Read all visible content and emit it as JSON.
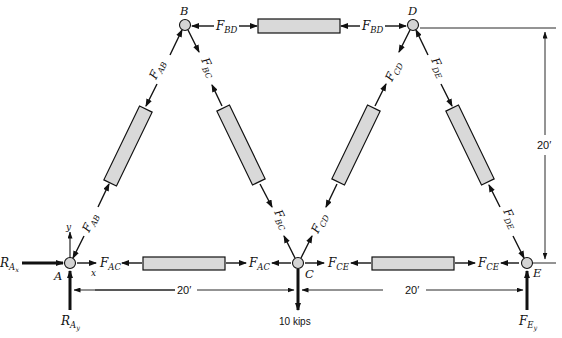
{
  "diagram": {
    "type": "truss free-body diagram",
    "colors": {
      "line": "#111111",
      "member_fill": "#d9d9d9",
      "joint_fill": "#d4d4d4"
    },
    "joints": [
      {
        "id": "A",
        "label": "A",
        "x": 70,
        "y": 263
      },
      {
        "id": "B",
        "label": "B",
        "x": 185,
        "y": 25
      },
      {
        "id": "C",
        "label": "C",
        "x": 298,
        "y": 263
      },
      {
        "id": "D",
        "label": "D",
        "x": 413,
        "y": 25
      },
      {
        "id": "E",
        "label": "E",
        "x": 527,
        "y": 263
      }
    ],
    "members": [
      {
        "id": "AB",
        "force_label": "F",
        "force_sub": "AB"
      },
      {
        "id": "BC",
        "force_label": "F",
        "force_sub": "BC"
      },
      {
        "id": "BD",
        "force_label": "F",
        "force_sub": "BD"
      },
      {
        "id": "AC",
        "force_label": "F",
        "force_sub": "AC"
      },
      {
        "id": "CD",
        "force_label": "F",
        "force_sub": "CD"
      },
      {
        "id": "CE",
        "force_label": "F",
        "force_sub": "CE"
      },
      {
        "id": "DE",
        "force_label": "F",
        "force_sub": "DE"
      }
    ],
    "reactions": {
      "RAx": {
        "main": "R",
        "sub": "A",
        "subsub": "x"
      },
      "RAy": {
        "main": "R",
        "sub": "A",
        "subsub": "y"
      },
      "FEy": {
        "main": "F",
        "sub": "E",
        "subsub": "y"
      }
    },
    "load": {
      "label": "10 kips",
      "joint": "C"
    },
    "axes": {
      "x": "x",
      "y": "y"
    },
    "dimensions": {
      "span_AC": "20′",
      "span_CE": "20′",
      "height": "20′"
    }
  }
}
